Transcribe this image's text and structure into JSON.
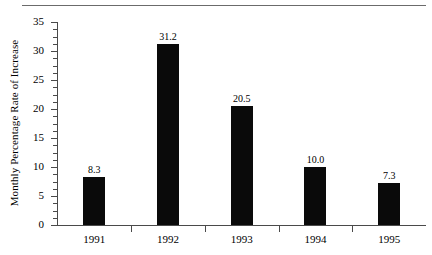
{
  "chart_data": {
    "type": "bar",
    "title": "",
    "subtitle": "",
    "xlabel": "",
    "ylabel": "Monthly Percentage Rate of Increase",
    "categories": [
      "1991",
      "1992",
      "1993",
      "1994",
      "1995"
    ],
    "values": [
      8.3,
      31.2,
      20.5,
      10.0,
      7.3
    ],
    "value_labels": [
      "8.3",
      "31.2",
      "20.5",
      "10.0",
      "7.3"
    ],
    "ylim": [
      0,
      35
    ],
    "ytick_labels": [
      "0",
      "5",
      "10",
      "15",
      "20",
      "25",
      "30",
      "35"
    ],
    "ytick_values": [
      0,
      5,
      10,
      15,
      20,
      25,
      30,
      35
    ],
    "yminor_step": 1.25,
    "grid": false,
    "legend": null,
    "bar_color": "#0a0a0a",
    "axis_color": "#4a4a4a",
    "rule_color": "#6b6b6b",
    "background": "#ffffff"
  }
}
